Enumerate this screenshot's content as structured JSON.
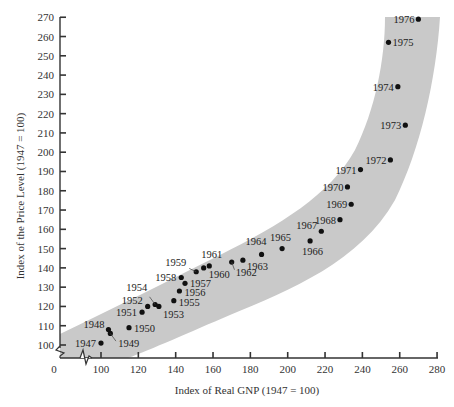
{
  "chart_data": {
    "type": "scatter",
    "title": "",
    "xlabel": "Index of Real GNP (1947 = 100)",
    "ylabel": "Index of the Price Level (1947 = 100)",
    "xlim": [
      0,
      280
    ],
    "ylim": [
      95,
      270
    ],
    "x_axis_break": true,
    "y_axis_break": true,
    "x_ticks": [
      0,
      100,
      120,
      140,
      160,
      180,
      200,
      220,
      240,
      260,
      280
    ],
    "y_ticks": [
      100,
      110,
      120,
      130,
      140,
      150,
      160,
      170,
      180,
      190,
      200,
      210,
      220,
      230,
      240,
      250,
      260,
      270
    ],
    "grid": false,
    "legend": null,
    "band": {
      "description": "shaded gray band enclosing trend of points",
      "color": "#c8c8c8"
    },
    "points": [
      {
        "label": "1947",
        "x": 100,
        "y": 101
      },
      {
        "label": "1948",
        "x": 104,
        "y": 108
      },
      {
        "label": "1949",
        "x": 105,
        "y": 106
      },
      {
        "label": "1950",
        "x": 115,
        "y": 109
      },
      {
        "label": "1951",
        "x": 122,
        "y": 117
      },
      {
        "label": "1952",
        "x": 125,
        "y": 120
      },
      {
        "label": "1953",
        "x": 131,
        "y": 120
      },
      {
        "label": "1954",
        "x": 129,
        "y": 121
      },
      {
        "label": "1955",
        "x": 139,
        "y": 123
      },
      {
        "label": "1956",
        "x": 142,
        "y": 128
      },
      {
        "label": "1957",
        "x": 145,
        "y": 132
      },
      {
        "label": "1958",
        "x": 143,
        "y": 135
      },
      {
        "label": "1959",
        "x": 151,
        "y": 138
      },
      {
        "label": "1960",
        "x": 155,
        "y": 140
      },
      {
        "label": "1961",
        "x": 158,
        "y": 141
      },
      {
        "label": "1962",
        "x": 170,
        "y": 143
      },
      {
        "label": "1963",
        "x": 176,
        "y": 144
      },
      {
        "label": "1964",
        "x": 186,
        "y": 147
      },
      {
        "label": "1965",
        "x": 197,
        "y": 150
      },
      {
        "label": "1966",
        "x": 212,
        "y": 154
      },
      {
        "label": "1967",
        "x": 218,
        "y": 159
      },
      {
        "label": "1968",
        "x": 228,
        "y": 165
      },
      {
        "label": "1969",
        "x": 234,
        "y": 173
      },
      {
        "label": "1970",
        "x": 232,
        "y": 182
      },
      {
        "label": "1971",
        "x": 239,
        "y": 191
      },
      {
        "label": "1972",
        "x": 255,
        "y": 196
      },
      {
        "label": "1973",
        "x": 263,
        "y": 214
      },
      {
        "label": "1974",
        "x": 259,
        "y": 234
      },
      {
        "label": "1975",
        "x": 254,
        "y": 257
      },
      {
        "label": "1976",
        "x": 270,
        "y": 269
      }
    ]
  },
  "axes": {
    "x_title": "Index of Real GNP (1947 = 100)",
    "y_title": "Index of the Price Level (1947 = 100)",
    "origin_label": "0"
  },
  "colors": {
    "band": "#c9c9c9",
    "point": "#111111",
    "axis": "#333333"
  }
}
